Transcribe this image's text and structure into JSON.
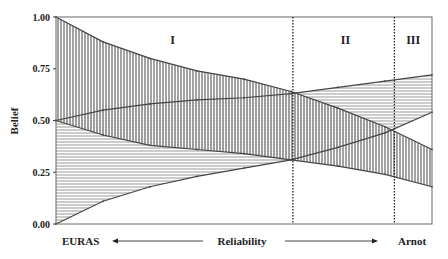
{
  "chart_data": {
    "type": "area",
    "title": "",
    "xlabel": "Reliability",
    "ylabel": "Belief",
    "x_left_label": "EURAS",
    "x_right_label": "Arnot",
    "ylim": [
      0,
      1
    ],
    "xlim": [
      0,
      1
    ],
    "yticks": [
      "0.00",
      "0.25",
      "0.50",
      "0.75",
      "1.00"
    ],
    "ytick_values": [
      0,
      0.25,
      0.5,
      0.75,
      1.0
    ],
    "grid": false,
    "x": [
      0,
      0.125,
      0.25,
      0.375,
      0.5,
      0.625,
      0.75,
      0.875,
      1.0
    ],
    "series": [
      {
        "name": "upper-bound-decreasing",
        "values": [
          1.0,
          0.88,
          0.8,
          0.74,
          0.7,
          0.64,
          0.56,
          0.47,
          0.36
        ]
      },
      {
        "name": "upper-bound-increasing",
        "values": [
          0.5,
          0.55,
          0.58,
          0.6,
          0.61,
          0.63,
          0.66,
          0.69,
          0.72
        ]
      },
      {
        "name": "lower-bound-decreasing",
        "values": [
          0.5,
          0.43,
          0.38,
          0.36,
          0.34,
          0.31,
          0.28,
          0.24,
          0.18
        ]
      },
      {
        "name": "lower-bound-increasing",
        "values": [
          0.0,
          0.11,
          0.18,
          0.23,
          0.27,
          0.31,
          0.37,
          0.44,
          0.54
        ]
      }
    ],
    "region_dividers": [
      0.63,
      0.9
    ],
    "regions": [
      {
        "label": "I",
        "x_center": 0.31
      },
      {
        "label": "II",
        "x_center": 0.77
      },
      {
        "label": "III",
        "x_center": 0.95
      }
    ],
    "shading": {
      "decreasing_band": "vertical-hatch",
      "increasing_band": "horizontal-hatch",
      "overlap": "cross-hatch"
    }
  },
  "colors": {
    "line": "#444444",
    "hatch": "#555555",
    "axis": "#666666"
  }
}
